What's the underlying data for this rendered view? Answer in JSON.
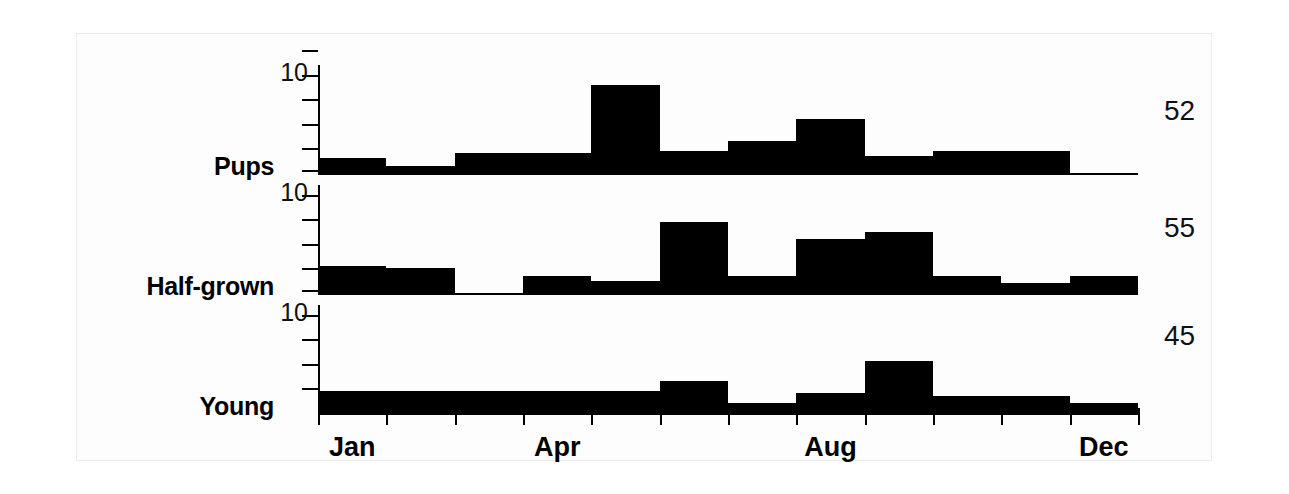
{
  "figure": {
    "background": "#ffffff",
    "ink_color": "#000000"
  },
  "chart_data": {
    "type": "bar",
    "title": "",
    "subtitle": "",
    "xlabel": "",
    "ylabel": "",
    "grid": false,
    "legend": "none",
    "categories": [
      "Jan",
      "Feb",
      "Mar",
      "Apr",
      "May",
      "Jun",
      "Jul",
      "Aug",
      "Sep",
      "Oct",
      "Nov",
      "Dec"
    ],
    "x_tick_labels_shown": [
      "Jan",
      "Apr",
      "Aug",
      "Dec"
    ],
    "x_tick_count": 13,
    "y_tick_count": 5,
    "y_tick_label": "10",
    "y_tick_label_index_from_bottom": 3,
    "ylim": [
      0,
      22
    ],
    "panels": [
      {
        "label": "Pups",
        "n": "52",
        "values": [
          3,
          1.5,
          4,
          4,
          18,
          4.5,
          6.5,
          11,
          3.5,
          4.5,
          4.5,
          0
        ]
      },
      {
        "label": "Half-grown",
        "n": "55",
        "values": [
          5.5,
          5,
          0,
          3.5,
          2.5,
          14.5,
          3.5,
          11,
          12.5,
          3.5,
          2,
          3.5
        ]
      },
      {
        "label": "Young",
        "n": "45",
        "values": [
          4.5,
          4.5,
          4.5,
          4.5,
          4.5,
          6.5,
          2,
          4,
          10.5,
          3.5,
          3.5,
          2
        ]
      }
    ]
  }
}
